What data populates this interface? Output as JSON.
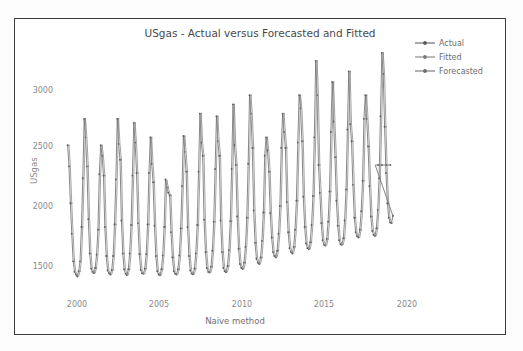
{
  "figure": {
    "title": "USgas - Actual versus Forecasted and Fitted",
    "scan_artifact_text": ""
  },
  "legend": {
    "items": [
      {
        "label": "Actual",
        "color": "#6e6e6e",
        "icon": "line-marker-icon"
      },
      {
        "label": "Fitted",
        "color": "#828282",
        "icon": "line-marker-icon"
      },
      {
        "label": "Forecasted",
        "color": "#767676",
        "icon": "line-marker-icon"
      }
    ]
  },
  "chart_data": {
    "type": "line",
    "title": "USgas - Actual versus Forecasted and Fitted",
    "xlabel": "Naive method",
    "ylabel": "USgas",
    "xlim": [
      1999.6,
      2020.4
    ],
    "ylim": [
      1380,
      3260
    ],
    "xticks": [
      2000,
      2005,
      2010,
      2015,
      2020
    ],
    "yticks": [
      1500,
      2000,
      2500,
      3000
    ],
    "grid": false,
    "legend_position": "top-right-outside",
    "line_color": "#727272",
    "marker": "circle",
    "series": [
      {
        "name": "Actual",
        "color": "#6e6e6e",
        "x_start": 2000.0,
        "x_step": 0.08333,
        "values": [
          2500,
          2340,
          2060,
          1830,
          1620,
          1540,
          1520,
          1505,
          1545,
          1620,
          1880,
          2250,
          2700,
          2560,
          2340,
          1940,
          1680,
          1565,
          1540,
          1530,
          1570,
          1670,
          1860,
          2280,
          2500,
          2420,
          2270,
          1880,
          1660,
          1550,
          1530,
          1520,
          1555,
          1660,
          1900,
          2240,
          2700,
          2510,
          2390,
          1930,
          1680,
          1560,
          1525,
          1515,
          1560,
          1680,
          1895,
          2270,
          2670,
          2520,
          2290,
          1910,
          1675,
          1555,
          1530,
          1525,
          1565,
          1675,
          1900,
          2290,
          2560,
          2360,
          2220,
          1890,
          1660,
          1545,
          1520,
          1515,
          1560,
          1665,
          1880,
          2240,
          2180,
          2140,
          2120,
          1840,
          1650,
          1545,
          1525,
          1520,
          1560,
          1665,
          1870,
          2190,
          2570,
          2450,
          2300,
          1880,
          1660,
          1550,
          1528,
          1522,
          1565,
          1680,
          1895,
          2300,
          2740,
          2520,
          2420,
          1935,
          1690,
          1570,
          1540,
          1535,
          1580,
          1700,
          1920,
          2320,
          2720,
          2530,
          2420,
          1930,
          1690,
          1570,
          1545,
          1538,
          1585,
          1705,
          1925,
          2320,
          2810,
          2500,
          2350,
          1960,
          1715,
          1600,
          1570,
          1562,
          1610,
          1730,
          1950,
          2360,
          2880,
          2740,
          2480,
          2005,
          1760,
          1640,
          1610,
          1600,
          1650,
          1775,
          1990,
          2420,
          2560,
          2460,
          2300,
          1985,
          1800,
          1690,
          1660,
          1650,
          1700,
          1830,
          2040,
          2480,
          2740,
          2600,
          2480,
          2070,
          1840,
          1720,
          1690,
          1680,
          1730,
          1860,
          2080,
          2520,
          2880,
          2780,
          2530,
          2110,
          1880,
          1755,
          1720,
          1712,
          1765,
          1895,
          2115,
          2560,
          3140,
          2880,
          2350,
          2140,
          1910,
          1780,
          1745,
          1740,
          1790,
          1920,
          2150,
          2600,
          2980,
          2680,
          2410,
          2080,
          1890,
          1780,
          1750,
          1745,
          1795,
          1930,
          2165,
          2620,
          3060,
          2660,
          2530,
          2200,
          1950,
          1840,
          1810,
          1800,
          1860,
          2000,
          2230,
          2700,
          2880,
          2700,
          2490,
          2190,
          1960,
          1850,
          1820,
          1812,
          1870,
          2010,
          2250,
          2720,
          3200,
          3040,
          2640,
          2290,
          2060,
          1950,
          1915,
          1910,
          1965
        ]
      },
      {
        "name": "Fitted",
        "color": "#828282",
        "note": "naive one-step-ahead fit: previous observation carried forward, drawn nearly overlapping Actual"
      },
      {
        "name": "Forecasted",
        "color": "#767676",
        "note": "flat naive forecast held at the last observed value",
        "x_start": 2018.6,
        "x_step": 0.08333,
        "values": [
          2350,
          2350,
          2350,
          2350,
          2350,
          2350,
          2350,
          2350,
          2350,
          2350,
          2350,
          2350
        ]
      }
    ],
    "annotations": [
      {
        "text": "Forecast horizon begins at the end of the actual series (≈2018.6)"
      },
      {
        "text": "Seasonal peaks in winter months, troughs in summer months"
      }
    ]
  },
  "axes": {
    "y_ticks": [
      "3000",
      "2500",
      "2000",
      "1500"
    ],
    "x_ticks": [
      "2000",
      "2005",
      "2010",
      "2015",
      "2020"
    ],
    "y_title": "USgas",
    "x_title": "Naive method"
  }
}
